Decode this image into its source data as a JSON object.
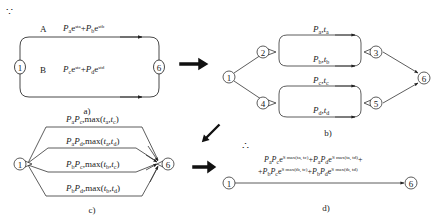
{
  "therefore_symbol": "∵",
  "hence_symbol": "∴",
  "panel_a": {
    "caption": "a)",
    "nodes": [
      "1",
      "6"
    ],
    "paths": [
      {
        "name": "A",
        "label": {
          "P1": "P",
          "s1": "a",
          "e1": "e",
          "x1": "sta",
          "plus": "+",
          "P2": "P",
          "s2": "b",
          "e2": "e",
          "x2": "stb"
        }
      },
      {
        "name": "B",
        "label": {
          "P1": "P",
          "s1": "c",
          "e1": "e",
          "x1": "stc",
          "plus": "+",
          "P2": "P",
          "s2": "d",
          "e2": "e",
          "x2": "std"
        }
      }
    ]
  },
  "panel_b": {
    "caption": "b)",
    "nodes": [
      "1",
      "2",
      "3",
      "4",
      "5",
      "6"
    ],
    "edges": [
      {
        "P": "P",
        "ps": "a",
        "t": "t",
        "ts": "a"
      },
      {
        "P": "P",
        "ps": "b",
        "t": "t",
        "ts": "b"
      },
      {
        "P": "P",
        "ps": "c",
        "t": "t",
        "ts": "c"
      },
      {
        "P": "P",
        "ps": "d",
        "t": "t",
        "ts": "d"
      }
    ]
  },
  "panel_c": {
    "caption": "c)",
    "nodes": [
      "1",
      "6"
    ],
    "paths": [
      {
        "P1s": "a",
        "P2s": "c",
        "t1": "a",
        "t2": "c"
      },
      {
        "P1s": "a",
        "P2s": "d",
        "t1": "a",
        "t2": "d"
      },
      {
        "P1s": "b",
        "P2s": "c",
        "t1": "b",
        "t2": "c"
      },
      {
        "P1s": "b",
        "P2s": "d",
        "t1": "b",
        "t2": "d"
      }
    ],
    "P": "P",
    "max": "max",
    "t": "t"
  },
  "panel_d": {
    "caption": "d)",
    "nodes": [
      "1",
      "6"
    ],
    "formula_line1": [
      {
        "P1s": "a",
        "P2s": "c",
        "exp": "S max(ta, tc)"
      },
      {
        "P1s": "a",
        "P2s": "d",
        "exp": "S max(ta, td)"
      }
    ],
    "formula_line2": [
      {
        "P1s": "b",
        "P2s": "c",
        "exp": "S max(tb, tc)"
      },
      {
        "P1s": "b",
        "P2s": "d",
        "exp": "S max(tb, td)"
      }
    ]
  }
}
